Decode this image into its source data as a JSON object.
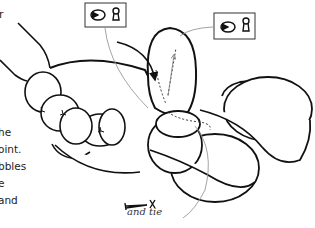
{
  "text_fragments": {
    "top_left": "r",
    "left_column": [
      "he",
      "oint.",
      "bbles",
      "e",
      "and"
    ]
  },
  "caption": "and tie",
  "icons": [
    {
      "name": "twist-lock-icon",
      "label": "twist and lock",
      "box": "top-center"
    },
    {
      "name": "twist-lock-icon",
      "label": "twist and lock",
      "box": "top-right"
    }
  ],
  "colors": {
    "line": "#111111",
    "guide": "#999999",
    "background": "#ffffff"
  }
}
